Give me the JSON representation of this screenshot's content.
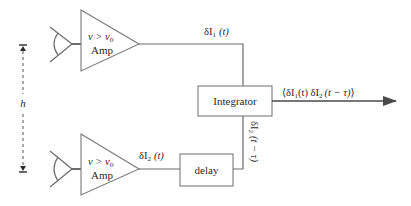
{
  "diagram": {
    "type": "block-diagram",
    "colors": {
      "line": "#6b6b6b",
      "text": "#2a2a2a",
      "arrow": "#4a4a4a",
      "background": "#ffffff"
    },
    "baseline": {
      "label": "h"
    },
    "amplifiers": [
      {
        "id": "amp-1",
        "condition": "v > v",
        "condition_sub": "o",
        "label": "Amp"
      },
      {
        "id": "amp-2",
        "condition": "v > v",
        "condition_sub": "o",
        "label": "Amp"
      }
    ],
    "signals": {
      "s1": {
        "prefix": "δI",
        "sub": "1",
        "arg": "(t)"
      },
      "s2": {
        "prefix": "δI",
        "sub": "2",
        "arg": "(t)"
      },
      "s2_delayed": {
        "prefix": "δI",
        "sub": "2",
        "arg": "(t − τ)"
      }
    },
    "blocks": {
      "integrator": "Integrator",
      "delay": "delay"
    },
    "output": {
      "open": "⟨",
      "p1": "δI",
      "s1": "1",
      "a1": "(t) ",
      "p2": "δI",
      "s2": "2",
      "a2": "(t − τ)",
      "close": "⟩"
    }
  }
}
